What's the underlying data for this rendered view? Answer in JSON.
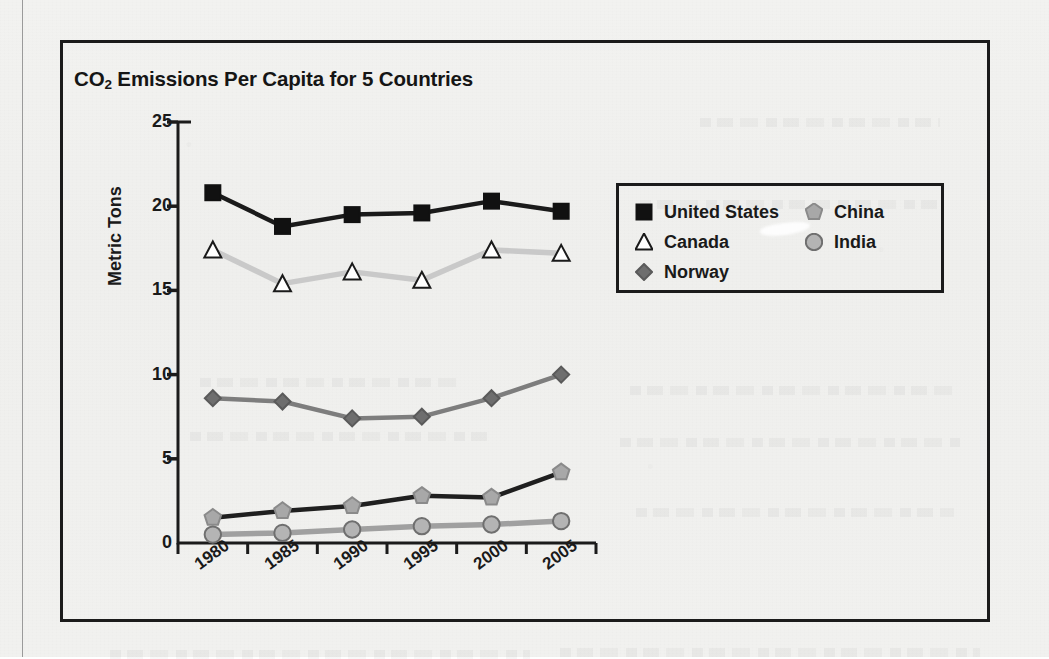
{
  "chart_data": {
    "type": "line",
    "title": "CO2 Emissions Per Capita for 5 Countries",
    "title_main": "CO",
    "title_sub": "2",
    "title_rest": " Emissions Per Capita for 5 Countries",
    "xlabel": "",
    "ylabel": "Metric Tons",
    "categories": [
      "1980",
      "1985",
      "1990",
      "1995",
      "2000",
      "2005"
    ],
    "x_tick_labels": [
      "1980",
      "1985",
      "1990",
      "1995",
      "2000",
      "2005"
    ],
    "y_tick_labels": [
      "0",
      "5",
      "10",
      "15",
      "20",
      "25"
    ],
    "y_ticks": [
      0,
      5,
      10,
      15,
      20,
      25
    ],
    "ylim": [
      0,
      25
    ],
    "grid": false,
    "legend_position": "upper-right-outside",
    "series": [
      {
        "name": "United States",
        "values": [
          20.8,
          18.8,
          19.5,
          19.6,
          20.3,
          19.7
        ],
        "marker": "square",
        "line_color": "#1a1a1a",
        "marker_fill": "#111111",
        "marker_stroke": "#111111"
      },
      {
        "name": "Canada",
        "values": [
          17.4,
          15.4,
          16.1,
          15.6,
          17.4,
          17.2
        ],
        "marker": "triangle",
        "line_color": "#c9c9c9",
        "marker_fill": "#ffffff",
        "marker_stroke": "#1a1a1a"
      },
      {
        "name": "Norway",
        "values": [
          8.6,
          8.4,
          7.4,
          7.5,
          8.6,
          10.0
        ],
        "marker": "diamond",
        "line_color": "#7d7d7d",
        "marker_fill": "#6e6e6e",
        "marker_stroke": "#5a5a5a"
      },
      {
        "name": "China",
        "values": [
          1.5,
          1.9,
          2.2,
          2.8,
          2.7,
          4.2
        ],
        "marker": "pentagon",
        "line_color": "#1f1f1f",
        "marker_fill": "#a8a8a8",
        "marker_stroke": "#8a8a8a"
      },
      {
        "name": "India",
        "values": [
          0.5,
          0.6,
          0.8,
          1.0,
          1.1,
          1.3
        ],
        "marker": "circle",
        "line_color": "#a0a0a0",
        "marker_fill": "#b4b4b4",
        "marker_stroke": "#6f6f6f"
      }
    ]
  },
  "legend": {
    "left_column": [
      "United States",
      "Canada",
      "Norway"
    ],
    "right_column": [
      "China",
      "India"
    ]
  },
  "colors": {
    "frame": "#1b1b1b",
    "text": "#1a1a1a",
    "page_background": "#f1f1ef"
  }
}
